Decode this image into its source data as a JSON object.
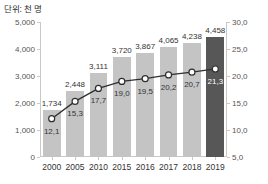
{
  "chart_data": {
    "type": "bar",
    "title": "단위: 천 명",
    "xlabel": "",
    "ylabel": "",
    "categories": [
      "2000",
      "2005",
      "2010",
      "2015",
      "2016",
      "2017",
      "2018",
      "2019"
    ],
    "series": [
      {
        "name": "인구",
        "type": "bar",
        "axis": "left",
        "values": [
          1734,
          2448,
          3111,
          3720,
          3867,
          4065,
          4238,
          4458
        ],
        "labels": [
          "1,734",
          "2,448",
          "3,111",
          "3,720",
          "3,867",
          "4,065",
          "4,238",
          "4,458"
        ],
        "color": "#c4c4c4",
        "highlight_index": 7,
        "highlight_color": "#575757"
      },
      {
        "name": "비율",
        "type": "line",
        "axis": "right",
        "values": [
          12.1,
          15.3,
          17.7,
          19.0,
          19.5,
          20.2,
          20.7,
          21.3
        ],
        "labels": [
          "12,1",
          "15,3",
          "17,7",
          "19,0",
          "19,5",
          "20,2",
          "20,7",
          "21,3"
        ],
        "color": "#2f2f2f",
        "marker": "circle-open"
      }
    ],
    "left_axis": {
      "ticks": [
        0,
        1000,
        2000,
        3000,
        4000,
        5000
      ],
      "tick_labels": [
        "0",
        "1,000",
        "2,000",
        "3,000",
        "4,000",
        "5,000"
      ],
      "min": 0,
      "max": 5000
    },
    "right_axis": {
      "ticks": [
        5.0,
        10.0,
        15.0,
        20.0,
        25.0,
        30.0
      ],
      "tick_labels": [
        "5,0",
        "10,0",
        "15,0",
        "20,0",
        "25,0",
        "30,0"
      ],
      "min": 5.0,
      "max": 30.0
    },
    "grid": false,
    "legend": "none"
  }
}
